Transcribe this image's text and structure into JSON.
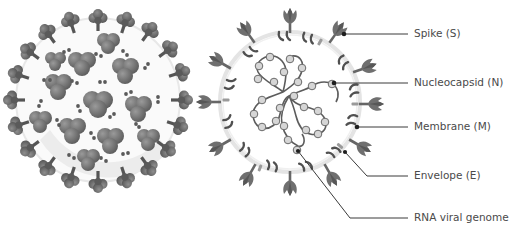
{
  "diagram": {
    "colors": {
      "background": "#ffffff",
      "spike_fill": "#7a7a7a",
      "spike_dark": "#5e5e5e",
      "membrane_ring": "#e6e6e6",
      "nucleocapsid_bead": "#d4d4d4",
      "nucleocapsid_stroke": "#6a6a6a",
      "rna_strand": "#5a5a5a",
      "leader_line": "#3a3a3a",
      "label_text": "#4a4a4a"
    },
    "left_virion": {
      "name": "exterior-3d-view",
      "cx": 98,
      "cy": 100,
      "r": 88
    },
    "right_virion": {
      "name": "cross-section-view",
      "cx": 290,
      "cy": 100,
      "r": 78
    },
    "labels": [
      {
        "id": "spike",
        "text": "Spike (S)",
        "x": 414,
        "y": 34,
        "anchor": [
          346,
          34
        ]
      },
      {
        "id": "nucleocapsid",
        "text": "Nucleocapsid (N)",
        "x": 414,
        "y": 83,
        "anchor": [
          334,
          83
        ]
      },
      {
        "id": "membrane",
        "text": "Membrane (M)",
        "x": 414,
        "y": 127,
        "anchor": [
          357,
          127
        ]
      },
      {
        "id": "envelope",
        "text": "Envelope (E)",
        "x": 414,
        "y": 176,
        "anchor": [
          345,
          152
        ],
        "elbow": [
          367,
          176
        ]
      },
      {
        "id": "rna",
        "text": "RNA viral genome",
        "x": 414,
        "y": 218,
        "anchor": [
          298,
          151
        ],
        "elbow": [
          350,
          218
        ]
      }
    ]
  }
}
